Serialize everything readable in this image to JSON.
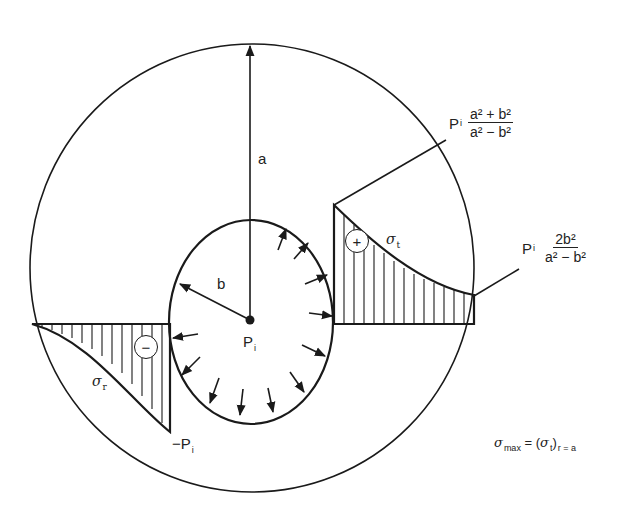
{
  "figure": {
    "outer_radius_label": "a",
    "inner_radius_label": "b",
    "pressure_label": "P",
    "pressure_sub": "i",
    "tangential_stress": {
      "symbol": "σ",
      "sub": "t",
      "sign": "+",
      "inner_value": {
        "prefix": "P",
        "prefix_sub": "i",
        "numerator": "a² + b²",
        "denominator": "a² − b²"
      },
      "outer_value": {
        "prefix": "P",
        "prefix_sub": "i",
        "numerator": "2b²",
        "denominator": "a² − b²"
      }
    },
    "radial_stress": {
      "symbol": "σ",
      "sub": "r",
      "sign": "−",
      "inner_value": "−P",
      "inner_value_sub": "i"
    },
    "max_stress_formula": {
      "lhs": "σ",
      "lhs_sub": "max",
      "eq": " = (",
      "rhs": "σ",
      "rhs_sub": "t",
      "close": ")",
      "cond_sub": "r = a"
    }
  }
}
